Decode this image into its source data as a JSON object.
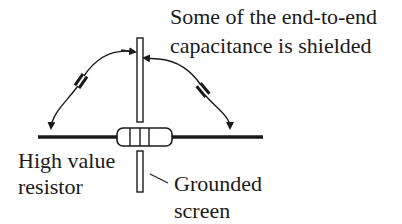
{
  "diagram": {
    "title_line1": "Some of the end-to-end",
    "title_line2": "capacitance is shielded",
    "resistor_label_line1": "High value",
    "resistor_label_line2": "resistor",
    "screen_label_line1": "Grounded",
    "screen_label_line2": "screen",
    "colors": {
      "ink": "#1a1a1a",
      "background": "#ffffff"
    },
    "components": [
      {
        "type": "resistor",
        "name": "high-value-resistor",
        "bands": 3
      },
      {
        "type": "screen",
        "name": "grounded-screen"
      },
      {
        "type": "capacitor",
        "name": "left-stray-capacitance"
      },
      {
        "type": "capacitor",
        "name": "right-stray-capacitance"
      }
    ]
  }
}
